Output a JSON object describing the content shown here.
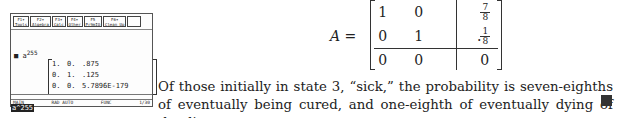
{
  "calculator": {
    "toolbar": [
      {
        "key": "F1▾",
        "label": "Tools"
      },
      {
        "key": "F2▾",
        "label": "Algebra"
      },
      {
        "key": "F3▾",
        "label": "Calc"
      },
      {
        "key": "F4▾",
        "label": "Other"
      },
      {
        "key": "F5",
        "label": "Pr9mIO"
      },
      {
        "key": "F6▾",
        "label": "Clean Up"
      }
    ],
    "entry_prefix": "■ a",
    "entry_exponent": "255",
    "result_matrix": [
      [
        "1.",
        "0.",
        ".875"
      ],
      [
        "0.",
        "1.",
        ".125"
      ],
      [
        "0.",
        "0.",
        "5.7896E-179"
      ]
    ],
    "command_line": "a^255",
    "status": {
      "mode": "MAIN",
      "angle": "RAD AUTO",
      "graph": "FUNC",
      "history": "1/30"
    }
  },
  "equation": {
    "lhs": "A =",
    "matrix": [
      [
        "1",
        "0",
        {
          "num": "7",
          "den": "8"
        }
      ],
      [
        "0",
        "1",
        {
          "num": "1",
          "den": "8"
        }
      ],
      [
        "0",
        "0",
        "0"
      ]
    ],
    "trailing": "."
  },
  "paragraph": "Of those initially in state 3, “sick,” the probability is seven-eighths of eventually being cured, and one-eighth of eventually dying of the disease.",
  "qed_symbol": "end-of-proof-square"
}
